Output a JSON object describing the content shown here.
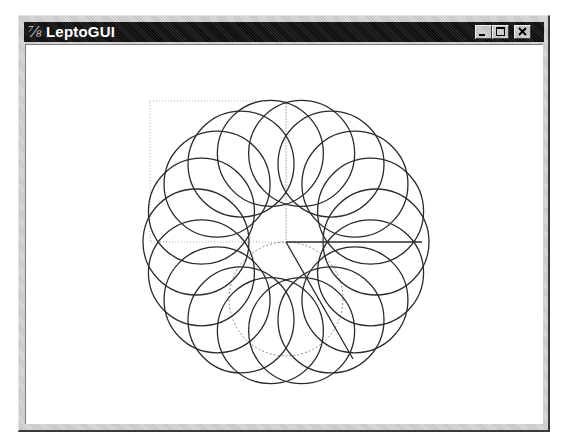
{
  "window": {
    "title": "LeptoGUI",
    "app_icon": "Tk feather",
    "controls": [
      {
        "name": "minimize",
        "icon": "minimize-icon"
      },
      {
        "name": "maximize",
        "icon": "maximize-icon"
      },
      {
        "name": "close",
        "icon": "close-icon"
      }
    ]
  },
  "drawing": {
    "center": [
      285,
      241
    ],
    "ring_circle_count": 18,
    "ring_distance": 90,
    "ring_radius": 53,
    "stroke_color": "#2a2a2a",
    "guide_color": "#b0b0b0",
    "guide_rect": {
      "x": 149,
      "y": 100,
      "w": 136,
      "h": 141
    },
    "guide_circle": {
      "cx": 285,
      "cy": 298,
      "r": 57
    },
    "radius_lines": [
      {
        "x2": 421,
        "y2": 241
      },
      {
        "x2": 352,
        "y2": 358
      }
    ]
  }
}
